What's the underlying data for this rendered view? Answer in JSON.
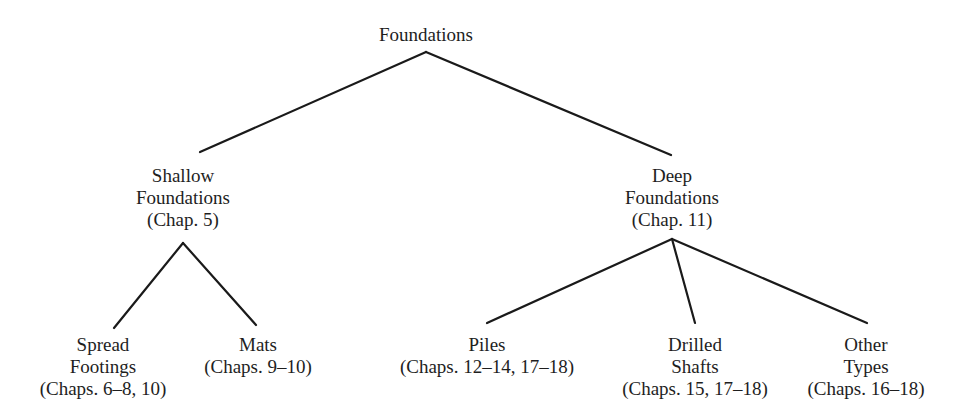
{
  "diagram": {
    "type": "tree",
    "root": {
      "label": "Foundations"
    },
    "level1": [
      {
        "id": "shallow",
        "lines": [
          "Shallow",
          "Foundations",
          "(Chap. 5)"
        ]
      },
      {
        "id": "deep",
        "lines": [
          "Deep",
          "Foundations",
          "(Chap. 11)"
        ]
      }
    ],
    "level2_shallow": [
      {
        "id": "spread-footings",
        "lines": [
          "Spread",
          "Footings",
          "(Chaps. 6–8, 10)"
        ]
      },
      {
        "id": "mats",
        "lines": [
          "Mats",
          "(Chaps. 9–10)"
        ]
      }
    ],
    "level2_deep": [
      {
        "id": "piles",
        "lines": [
          "Piles",
          "(Chaps. 12–14, 17–18)"
        ]
      },
      {
        "id": "drilled-shafts",
        "lines": [
          "Drilled",
          "Shafts",
          "(Chaps. 15, 17–18)"
        ]
      },
      {
        "id": "other-types",
        "lines": [
          "Other",
          "Types",
          "(Chaps. 16–18)"
        ]
      }
    ],
    "edges": [
      [
        "Foundations",
        "Shallow Foundations"
      ],
      [
        "Foundations",
        "Deep Foundations"
      ],
      [
        "Shallow Foundations",
        "Spread Footings"
      ],
      [
        "Shallow Foundations",
        "Mats"
      ],
      [
        "Deep Foundations",
        "Piles"
      ],
      [
        "Deep Foundations",
        "Drilled Shafts"
      ],
      [
        "Deep Foundations",
        "Other Types"
      ]
    ],
    "colors": {
      "text": "#1e1e1e",
      "lines": "#1a1a1a",
      "background": "#ffffff"
    }
  }
}
